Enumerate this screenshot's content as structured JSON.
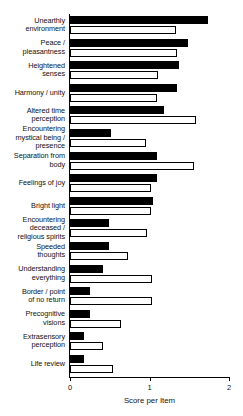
{
  "chart_data": {
    "type": "bar",
    "orientation": "horizontal",
    "title": "",
    "xlabel": "Score per Item",
    "ylabel": "",
    "xlim": [
      0,
      2
    ],
    "xticks": [
      0,
      1,
      2
    ],
    "xtick_labels": [
      "0",
      "1",
      "2"
    ],
    "grid": false,
    "legend": null,
    "categories": [
      "Unearthly environment",
      "Peace / pleasantness",
      "Heightened senses",
      "Harmony / unity",
      "Altered time perception",
      "Encountering mystical being / presence",
      "Separation from body",
      "Feelings of joy",
      "Bright light",
      "Encountering deceased / religious spirits",
      "Speeded thoughts",
      "Understanding everything",
      "Border / point of no return",
      "Precognitive visions",
      "Extrasensory perception",
      "Life review"
    ],
    "category_lines": [
      [
        "Unearthly",
        "environment"
      ],
      [
        "Peace /",
        "pleasantness"
      ],
      [
        "Heightened",
        "senses"
      ],
      [
        "Harmony / unity"
      ],
      [
        "Altered time",
        "perception"
      ],
      [
        "Encountering",
        "mystical being /",
        "presence"
      ],
      [
        "Separation from",
        "body"
      ],
      [
        "Feelings of joy"
      ],
      [
        "Bright light"
      ],
      [
        "Encountering",
        "deceased /",
        "religious spirits"
      ],
      [
        "Speeded",
        "thoughts"
      ],
      [
        "Understanding",
        "everything"
      ],
      [
        "Border / point",
        "of no return"
      ],
      [
        "Precognitive",
        "visions"
      ],
      [
        "Extrasensory",
        "perception"
      ],
      [
        "Life review"
      ]
    ],
    "series": [
      {
        "name": "series-dark",
        "color": "#000000",
        "style": "filled-black",
        "values": [
          1.74,
          1.48,
          1.37,
          1.35,
          1.18,
          0.51,
          1.1,
          1.09,
          1.04,
          0.49,
          0.49,
          0.42,
          0.25,
          0.25,
          0.18,
          0.18
        ]
      },
      {
        "name": "series-light",
        "color": "#ffffff",
        "style": "open-white",
        "values": [
          1.33,
          1.35,
          1.11,
          1.1,
          1.58,
          0.96,
          1.56,
          1.02,
          1.02,
          0.97,
          0.73,
          1.03,
          1.03,
          0.64,
          0.42,
          0.54
        ]
      }
    ]
  }
}
